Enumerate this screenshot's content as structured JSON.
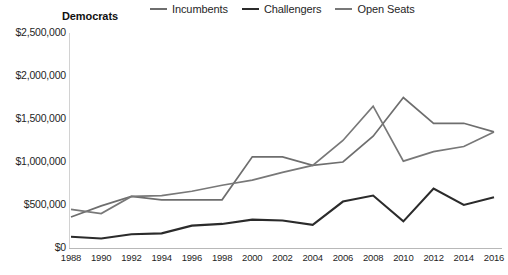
{
  "chart_data": {
    "type": "line",
    "title": "Democrats",
    "xlabel": "",
    "ylabel": "",
    "grid": false,
    "legend_position": "top-right",
    "ylim": [
      0,
      2500000
    ],
    "ytick_labels": [
      "$2,500,000",
      "$2,000,000",
      "$1,500,000",
      "$1,000,000",
      "$500,000",
      "$0"
    ],
    "ytick_values": [
      2500000,
      2000000,
      1500000,
      1000000,
      500000,
      0
    ],
    "categories": [
      1988,
      1990,
      1992,
      1994,
      1996,
      1998,
      2000,
      2002,
      2004,
      2006,
      2008,
      2010,
      2012,
      2014,
      2016
    ],
    "xtick_labels": [
      "1988",
      "1990",
      "1992",
      "1994",
      "1996",
      "1998",
      "2000",
      "2002",
      "2004",
      "2006",
      "2008",
      "2010",
      "2012",
      "2014",
      "2016"
    ],
    "series": [
      {
        "name": "Incumbents",
        "color": "#6e6e6e",
        "values": [
          360000,
          490000,
          600000,
          560000,
          560000,
          560000,
          1060000,
          1060000,
          960000,
          1000000,
          1300000,
          1750000,
          1450000,
          1450000,
          1350000
        ]
      },
      {
        "name": "Challengers",
        "color": "#2b2b2b",
        "values": [
          130000,
          110000,
          160000,
          170000,
          260000,
          280000,
          330000,
          320000,
          270000,
          540000,
          610000,
          310000,
          690000,
          500000,
          590000
        ]
      },
      {
        "name": "Open Seats",
        "color": "#787878",
        "values": [
          450000,
          400000,
          600000,
          610000,
          660000,
          730000,
          790000,
          880000,
          960000,
          1250000,
          1650000,
          1010000,
          1120000,
          1180000,
          1350000
        ]
      }
    ]
  },
  "legend": {
    "items": [
      {
        "label": "Incumbents",
        "color": "#6e6e6e"
      },
      {
        "label": "Challengers",
        "color": "#2b2b2b"
      },
      {
        "label": "Open Seats",
        "color": "#787878"
      }
    ]
  }
}
